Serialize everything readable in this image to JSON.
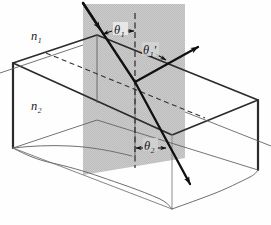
{
  "figure": {
    "type": "optics-refraction-reflection-3d-diagram",
    "caption": "",
    "media_labels": {
      "upper_medium": "n₁",
      "lower_medium": "n₂"
    },
    "angle_labels": {
      "incidence": "θ₁",
      "reflection": "θ₁′",
      "refraction": "θ₂"
    },
    "elements": {
      "plane_of_incidence": "plane-of-incidence",
      "normal": "surface-normal-dashed",
      "incident_ray": "incident-ray",
      "reflected_ray": "reflected-ray",
      "refracted_ray": "refracted-ray",
      "interface_block": "refracting-medium-block"
    },
    "colors": {
      "plane_fill": "#c9c9c9",
      "line": "#1a1a1a",
      "block_edge": "#2a2a2a",
      "thin_edge": "#3a3a3a"
    }
  }
}
